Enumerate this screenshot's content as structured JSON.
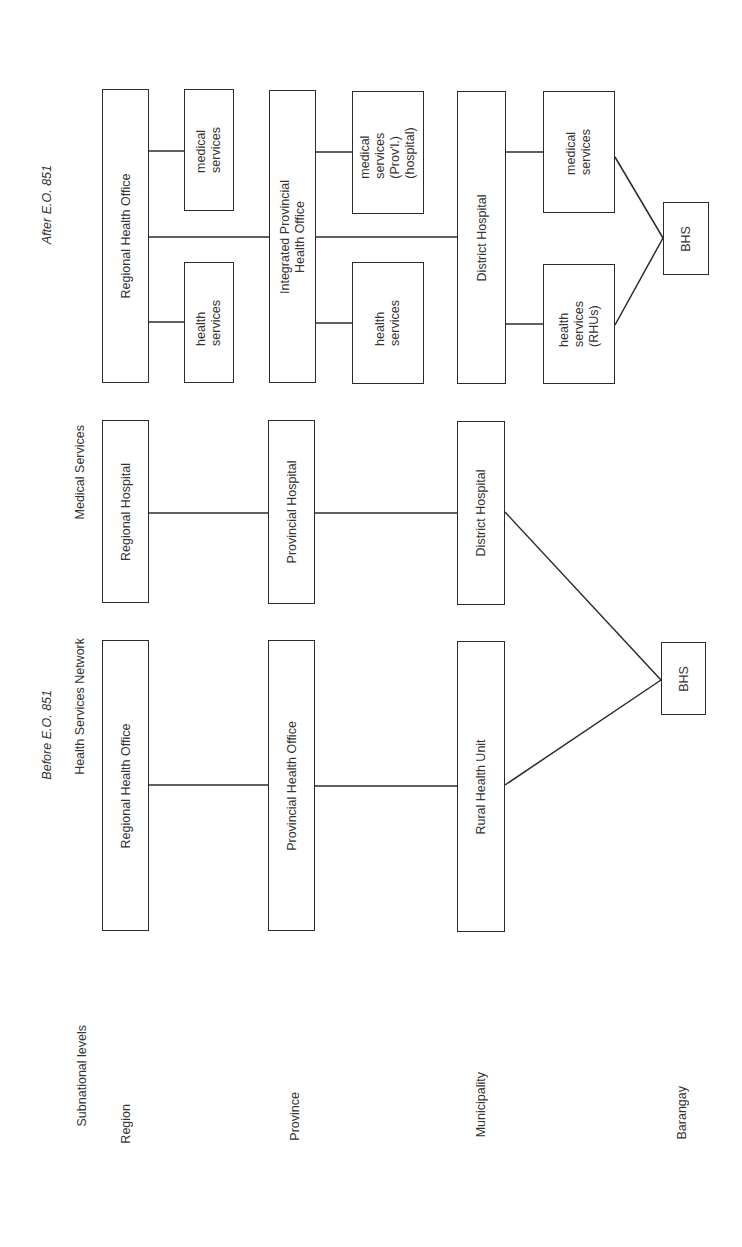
{
  "headings": {
    "before": "Before E.O. 851",
    "after": "After E.O. 851",
    "subnational": "Subnational levels",
    "health_network": "Health Services Network",
    "medical_services": "Medical Services"
  },
  "levels": [
    "Region",
    "Province",
    "Municipality",
    "Barangay"
  ],
  "before": {
    "health": [
      "Regional Health Office",
      "Provincial Health Office",
      "Rural Health Unit"
    ],
    "medical": [
      "Regional Hospital",
      "Provincial Hospital",
      "District Hospital"
    ],
    "bhs": "BHS"
  },
  "after": {
    "main": [
      "Regional Health Office",
      "Integrated Provincial\nHealth Office",
      "District Hospital"
    ],
    "region_sub": {
      "medical": "medical\nservices",
      "health": "health\nservices"
    },
    "province_sub": {
      "medical": "medical\nservices\n(Prov'l.)\n(hospital)",
      "health": "health\nservices"
    },
    "district_sub": {
      "medical": "medical\nservices",
      "health": "health\nservices\n(RHUs)"
    },
    "bhs": "BHS"
  }
}
